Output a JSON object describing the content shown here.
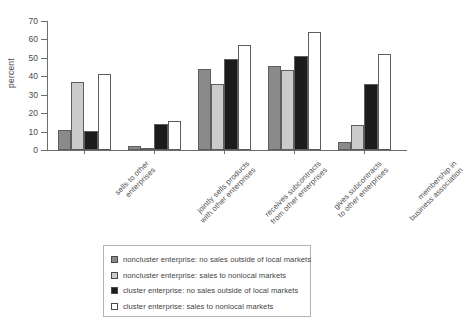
{
  "chart_data": {
    "type": "bar",
    "title": "",
    "subtitle": "",
    "xlabel": "",
    "ylabel": "percent",
    "ylim": [
      0,
      70
    ],
    "yticks": [
      0,
      10,
      20,
      30,
      40,
      50,
      60,
      70
    ],
    "grid": false,
    "legend_position": "bottom",
    "categories": [
      "sells to other enterprises",
      "jointly sells products with other enterprises",
      "receives subcontracts from other enterprises",
      "gives subcontracts to other enterprises",
      "membership in business association"
    ],
    "category_lines": [
      [
        "sells to other",
        "enterprises"
      ],
      [
        "jointly sells products",
        "with other enterprises"
      ],
      [
        "receives subcontracts",
        "from other enterprises"
      ],
      [
        "gives subcontracts",
        "to other enterprises"
      ],
      [
        "membership in",
        "business association"
      ]
    ],
    "series": [
      {
        "name": "noncluster enterprise: no sales outside of local markets",
        "color": "#8a8a8a",
        "values": [
          11,
          2,
          44,
          45.5,
          4.5
        ]
      },
      {
        "name": "noncluster enterprise: sales to nonlocal markets",
        "color": "#cbcbcb",
        "values": [
          37,
          1.2,
          36,
          43.5,
          13.5
        ]
      },
      {
        "name": "cluster enterprise: no sales outside of local markets",
        "color": "#1c1c1c",
        "values": [
          10.5,
          14,
          49.5,
          51,
          36
        ]
      },
      {
        "name": "cluster enterprise: sales to nonlocal markets",
        "color": "#ffffff",
        "values": [
          41.5,
          15.5,
          57,
          64,
          52
        ]
      }
    ]
  },
  "legend": {
    "items": [
      {
        "label": "noncluster enterprise: no sales outside of local markets",
        "color": "#8a8a8a"
      },
      {
        "label": "noncluster enterprise: sales to nonlocal markets",
        "color": "#cbcbcb"
      },
      {
        "label": "cluster enterprise: no sales outside of local markets",
        "color": "#1c1c1c"
      },
      {
        "label": "cluster enterprise: sales to nonlocal markets",
        "color": "#ffffff"
      }
    ]
  },
  "axis": {
    "y_title": "percent"
  }
}
